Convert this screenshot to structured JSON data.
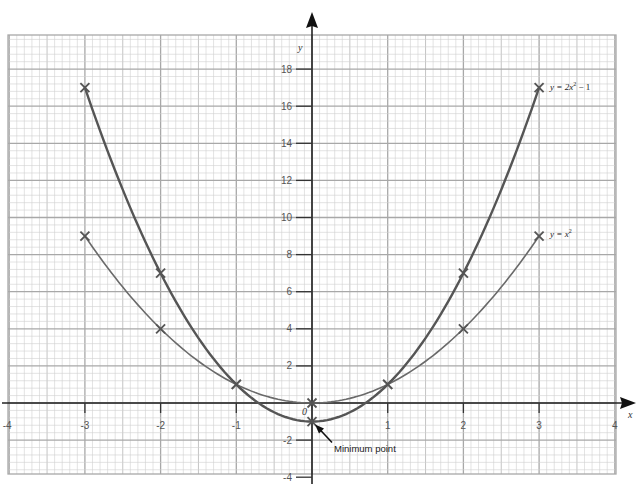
{
  "chart_data": {
    "type": "line",
    "title": "",
    "xlabel": "x",
    "ylabel": "y",
    "origin_label": "0",
    "xlim": [
      -4,
      4
    ],
    "ylim": [
      -4,
      19.5
    ],
    "x_ticks": [
      -4,
      -3,
      -2,
      -1,
      1,
      2,
      3,
      4
    ],
    "x_tick_labels": [
      "-4",
      "-3",
      "-2",
      "-1",
      "1",
      "2",
      "3",
      "4"
    ],
    "y_ticks": [
      -4,
      -2,
      2,
      4,
      6,
      8,
      10,
      12,
      14,
      16,
      18
    ],
    "y_tick_labels": [
      "-4",
      "-2",
      "2",
      "4",
      "6",
      "8",
      "10",
      "12",
      "14",
      "16",
      "18"
    ],
    "grid": true,
    "series": [
      {
        "name": "y = 2x² − 1",
        "label_main": "y = 2x",
        "label_sup": "2",
        "label_tail": " − 1",
        "x": [
          -3,
          -2,
          -1,
          0,
          1,
          2,
          3
        ],
        "y": [
          17,
          7,
          1,
          -1,
          1,
          7,
          17
        ],
        "color": "#555555"
      },
      {
        "name": "y = x²",
        "label_main": "y = x",
        "label_sup": "2",
        "label_tail": "",
        "x": [
          -3,
          -2,
          -1,
          0,
          1,
          2,
          3
        ],
        "y": [
          9,
          4,
          1,
          0,
          1,
          4,
          9
        ],
        "color": "#6a6a6a"
      }
    ],
    "annotations": [
      {
        "text": "Minimum point",
        "x": 0,
        "y": -1
      }
    ]
  }
}
